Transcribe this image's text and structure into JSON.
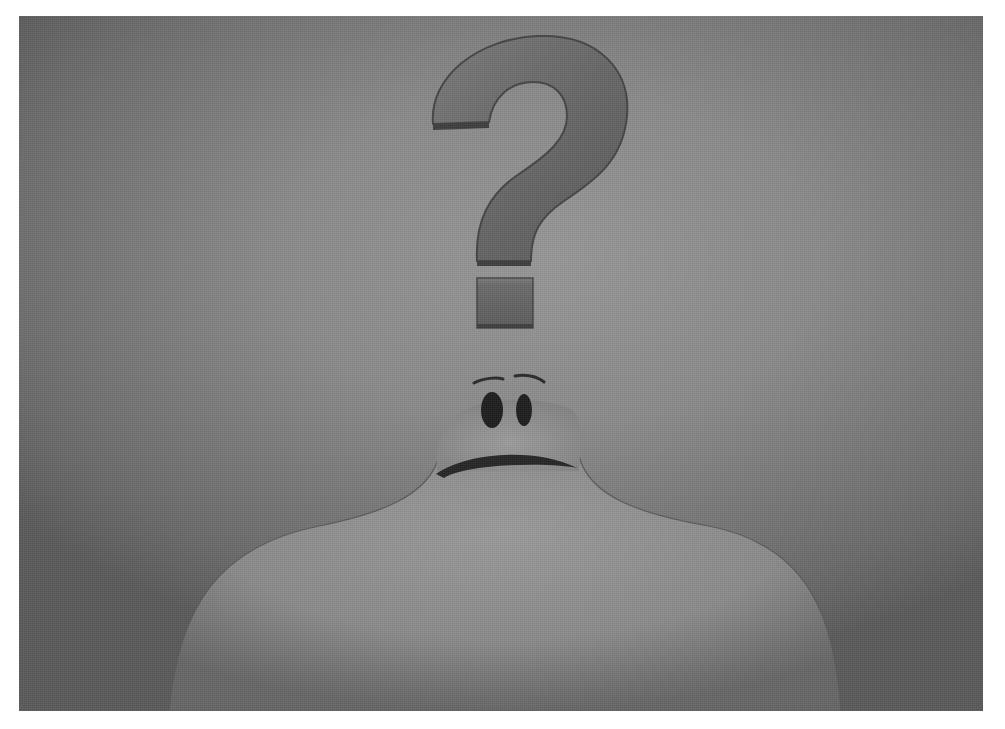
{
  "image": {
    "description": "3D-rendered grayscale illustration of a bald, featureless figure with small dark oval eyes, raised eyebrows and a frowning mouth, looking up at a large floating question mark against a textured gray backdrop",
    "subject": "puzzled figure",
    "symbol": "?",
    "colors": {
      "frame": "#ffffff",
      "background": "#8a8a8a",
      "background_edge": "#5a5a5a",
      "question_mark": "#6a6a6a",
      "question_mark_shadow": "#3e3e3e",
      "figure": "#8f8f8f",
      "figure_highlight": "#9c9c9c",
      "eyes": "#1e1e1e",
      "mouth": "#2a2a2a"
    }
  }
}
